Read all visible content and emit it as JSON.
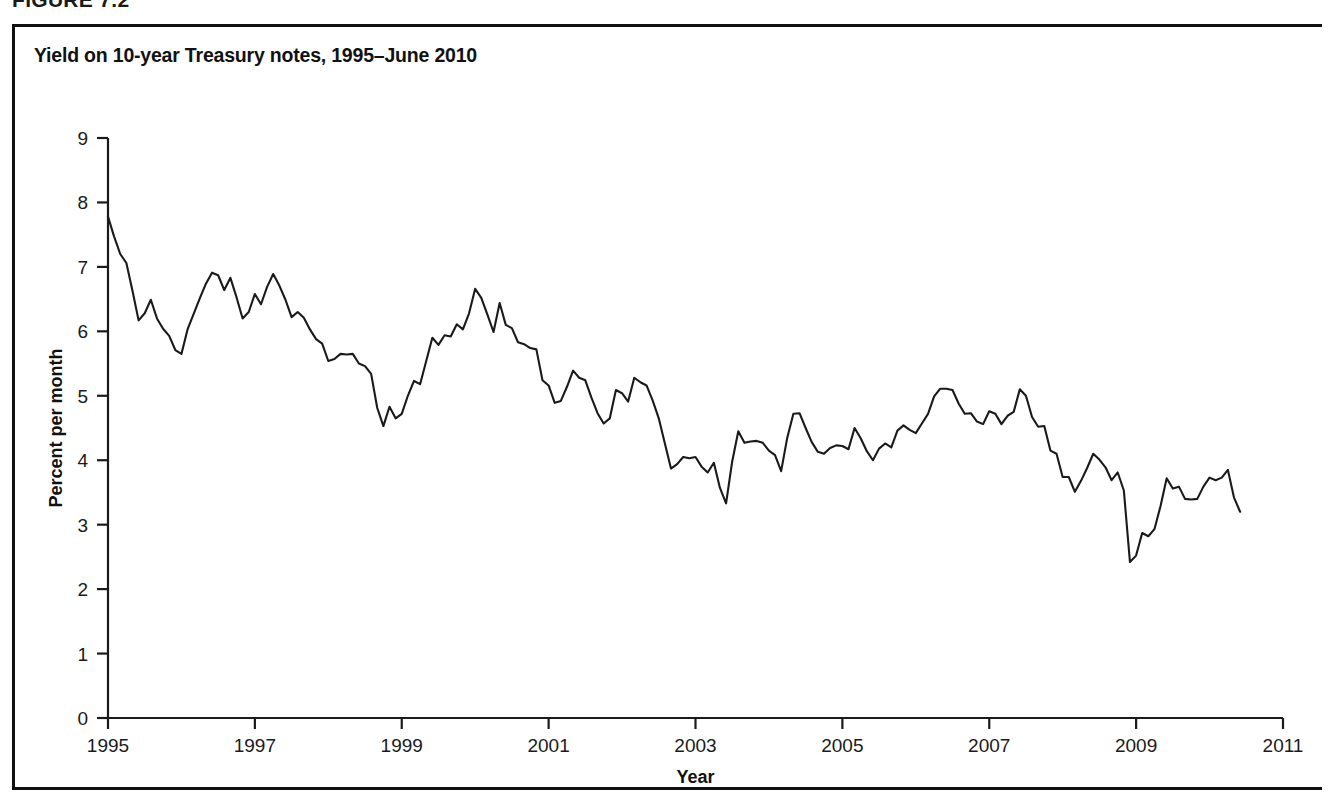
{
  "figure": {
    "caption": "FIGURE 7.2",
    "title": "Yield on 10-year Treasury notes, 1995–June 2010"
  },
  "colors": {
    "line": "#1a1a1a",
    "axis": "#1a1a1a",
    "background": "#ffffff",
    "border": "#111111"
  },
  "chart_data": {
    "type": "line",
    "title": "Yield on 10-year Treasury notes, 1995–June 2010",
    "xlabel": "Year",
    "ylabel": "Percent per month",
    "xlim": [
      1995,
      2011
    ],
    "ylim": [
      0,
      9
    ],
    "xticks": [
      1995,
      1997,
      1999,
      2001,
      2003,
      2005,
      2007,
      2009,
      2011
    ],
    "xticklabels": [
      "1995",
      "1997",
      "1999",
      "2001",
      "2003",
      "2005",
      "2007",
      "2009",
      "2011"
    ],
    "yticks": [
      0,
      1,
      2,
      3,
      4,
      5,
      6,
      7,
      8,
      9
    ],
    "yticklabels": [
      "0",
      "1",
      "2",
      "3",
      "4",
      "5",
      "6",
      "7",
      "8",
      "9"
    ],
    "grid": false,
    "legend": false,
    "series": [
      {
        "name": "10-year Treasury note yield",
        "x_start": 1995.0,
        "x_step": 0.08333,
        "values": [
          7.78,
          7.47,
          7.2,
          7.06,
          6.63,
          6.17,
          6.28,
          6.49,
          6.2,
          6.04,
          5.93,
          5.71,
          5.65,
          6.03,
          6.27,
          6.51,
          6.74,
          6.91,
          6.87,
          6.64,
          6.83,
          6.53,
          6.2,
          6.3,
          6.58,
          6.42,
          6.69,
          6.89,
          6.71,
          6.49,
          6.22,
          6.3,
          6.21,
          6.03,
          5.88,
          5.81,
          5.54,
          5.57,
          5.65,
          5.64,
          5.65,
          5.5,
          5.46,
          5.34,
          4.81,
          4.53,
          4.83,
          4.65,
          4.72,
          5.0,
          5.23,
          5.18,
          5.54,
          5.9,
          5.79,
          5.94,
          5.92,
          6.11,
          6.03,
          6.28,
          6.66,
          6.52,
          6.26,
          5.99,
          6.44,
          6.1,
          6.05,
          5.83,
          5.8,
          5.74,
          5.72,
          5.24,
          5.16,
          4.89,
          4.92,
          5.14,
          5.39,
          5.28,
          5.24,
          4.97,
          4.73,
          4.57,
          4.65,
          5.09,
          5.04,
          4.91,
          5.28,
          5.21,
          5.16,
          4.93,
          4.65,
          4.26,
          3.87,
          3.94,
          4.05,
          4.03,
          4.05,
          3.9,
          3.81,
          3.96,
          3.57,
          3.33,
          3.98,
          4.45,
          4.27,
          4.29,
          4.3,
          4.27,
          4.15,
          4.08,
          3.83,
          4.35,
          4.72,
          4.73,
          4.5,
          4.28,
          4.13,
          4.1,
          4.19,
          4.23,
          4.22,
          4.17,
          4.5,
          4.34,
          4.14,
          4.0,
          4.18,
          4.26,
          4.2,
          4.46,
          4.54,
          4.47,
          4.42,
          4.57,
          4.72,
          4.99,
          5.11,
          5.11,
          5.09,
          4.88,
          4.72,
          4.73,
          4.6,
          4.56,
          4.76,
          4.72,
          4.56,
          4.69,
          4.75,
          5.1,
          5.0,
          4.67,
          4.52,
          4.53,
          4.15,
          4.1,
          3.74,
          3.74,
          3.51,
          3.68,
          3.88,
          4.1,
          4.01,
          3.89,
          3.69,
          3.81,
          3.53,
          2.42,
          2.52,
          2.87,
          2.82,
          2.93,
          3.29,
          3.72,
          3.56,
          3.59,
          3.4,
          3.39,
          3.4,
          3.59,
          3.73,
          3.69,
          3.73,
          3.85,
          3.42,
          3.2
        ],
        "start_label": "January 1995",
        "end_label": "June 2010",
        "min_value": 2.42,
        "max_value": 7.78,
        "units": "percent"
      }
    ]
  }
}
